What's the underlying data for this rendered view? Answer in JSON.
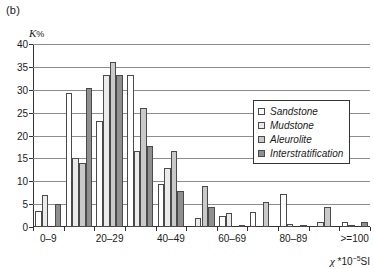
{
  "figure": {
    "panel_label": "(b)",
    "y_axis_caption_symbol": "K",
    "y_axis_caption_unit": "%",
    "x_axis_caption_symbol": "χ",
    "x_axis_caption_rest": " *10",
    "x_axis_caption_exp": "−5",
    "x_axis_caption_tail": "SI"
  },
  "legend": {
    "items": [
      {
        "label": "Sandstone",
        "color": "#ffffff"
      },
      {
        "label": "Mudstone",
        "color": "#ebebeb"
      },
      {
        "label": "Aleurolite",
        "color": "#c9c9c9"
      },
      {
        "label": "Interstratification",
        "color": "#8f8f8f"
      }
    ]
  },
  "chart_data": {
    "type": "bar",
    "title": "",
    "xlabel": "χ *10−5 SI",
    "ylabel": "K %",
    "ylim": [
      0,
      40
    ],
    "yticks": [
      0,
      5,
      10,
      15,
      20,
      25,
      30,
      35,
      40
    ],
    "grid": true,
    "legend_position": "inside-right",
    "categories": [
      "0–9",
      "10–19",
      "20–29",
      "30–39",
      "40–49",
      "50–59",
      "60–69",
      "70–79",
      "80–89",
      "90–99",
      ">=100"
    ],
    "visible_tick_labels": [
      "0–9",
      "",
      "20–29",
      "",
      "40–49",
      "",
      "60–69",
      "",
      "80–89",
      "",
      ">=100"
    ],
    "series": [
      {
        "name": "Sandstone",
        "color": "#ffffff",
        "values": [
          3.6,
          29.4,
          23.2,
          33.3,
          9.5,
          0.0,
          2.3,
          3.2,
          7.2,
          0.0,
          1.0
        ]
      },
      {
        "name": "Mudstone",
        "color": "#ebebeb",
        "values": [
          7.1,
          15.0,
          33.3,
          16.6,
          13.0,
          2.0,
          3.0,
          0.0,
          0.6,
          1.0,
          0.5
        ]
      },
      {
        "name": "Aleurolite",
        "color": "#c9c9c9",
        "values": [
          0.0,
          14.1,
          36.0,
          26.0,
          16.6,
          9.0,
          0.0,
          5.5,
          0.0,
          4.3,
          0.0
        ]
      },
      {
        "name": "Interstratification",
        "color": "#8f8f8f",
        "values": [
          5.0,
          30.3,
          33.3,
          17.8,
          7.8,
          4.4,
          0.5,
          0.0,
          0.5,
          0.0,
          1.2
        ]
      }
    ]
  }
}
